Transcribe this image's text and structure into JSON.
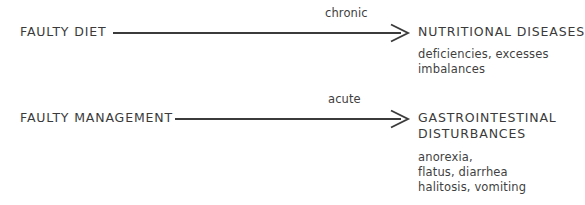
{
  "diagram": {
    "type": "flow-diagram",
    "background_color": "#ffffff",
    "text_color": "#3a3a3a",
    "line_color": "#3b3b3b",
    "width": 581,
    "height": 205,
    "rows": [
      {
        "id": "row-chronic",
        "source": "FAULTY DIET",
        "edge_label": "chronic",
        "arrow": {
          "style": "open-head",
          "direction": "right"
        },
        "target_title": "NUTRITIONAL DISEASES",
        "target_details": [
          "deficiencies, excesses",
          "imbalances"
        ]
      },
      {
        "id": "row-acute",
        "source": "FAULTY MANAGEMENT",
        "edge_label": "acute",
        "arrow": {
          "style": "open-head",
          "direction": "right"
        },
        "target_title_line1": "GASTROINTESTINAL",
        "target_title_line2": "DISTURBANCES",
        "target_details": [
          "anorexia,",
          "flatus, diarrhea",
          "halitosis, vomiting"
        ]
      }
    ]
  }
}
